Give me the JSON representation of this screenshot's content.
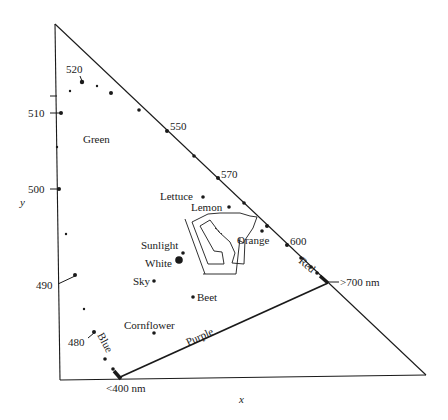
{
  "diagram": {
    "title": "",
    "axes": {
      "x_label": "x",
      "y_label": "y"
    },
    "regions": {
      "green": "Green",
      "blue": "Blue",
      "red": "Red",
      "purple": "Purple"
    },
    "wavelength_labels": {
      "w520": "520",
      "w510": "510",
      "w500": "500",
      "w490": "490",
      "w480": "480",
      "w550": "550",
      "w570": "570",
      "w600": "600",
      "w700": ">700 nm",
      "w400": "<400 nm"
    },
    "objects": {
      "lettuce": "Lettuce",
      "lemon": "Lemon",
      "orange": "Orange",
      "sunlight": "Sunlight",
      "white": "White",
      "sky": "Sky",
      "beet": "Beet",
      "cornflower": "Cornflower"
    },
    "colors": {
      "line": "#1a1a1a",
      "background": "#ffffff"
    }
  }
}
